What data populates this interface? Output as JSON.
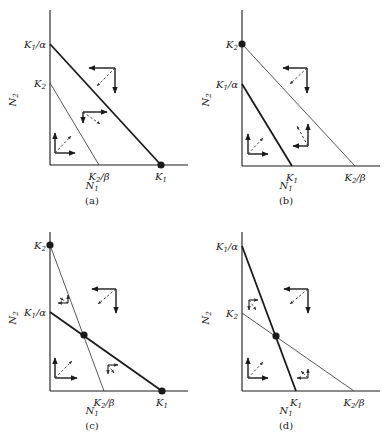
{
  "figure": {
    "background": "#ffffff",
    "ink": "#1a1a1a",
    "thin_line": "#444444",
    "panels": [
      {
        "id": "a",
        "caption": "(a)",
        "origin": [
          50,
          165
        ],
        "y_top": 10,
        "x_end": 188,
        "x_axis_label": "N1",
        "y_axis_label": "N2",
        "x_label_pos": [
          92,
          189
        ],
        "y_label_pos": [
          16,
          100
        ],
        "caption_pos": [
          92,
          204
        ],
        "lines": [
          {
            "name": "N1-isocline",
            "from": [
              50,
              44
            ],
            "to": [
              161,
              165
            ],
            "weight": "thick"
          },
          {
            "name": "N2-isocline",
            "from": [
              50,
              83
            ],
            "to": [
              99,
              165
            ],
            "weight": "thin"
          }
        ],
        "y_ticks": [
          {
            "text": "K1/α",
            "main": "K",
            "sub": "1",
            "suffix": "/α",
            "y": 44
          },
          {
            "text": "K2",
            "main": "K",
            "sub": "2",
            "suffix": "",
            "y": 83
          }
        ],
        "x_ticks": [
          {
            "text": "K2/β",
            "main": "K",
            "sub": "2",
            "suffix": "/β",
            "x": 99
          },
          {
            "text": "K1",
            "main": "K",
            "sub": "1",
            "suffix": "",
            "x": 161
          }
        ],
        "points": [
          [
            161,
            165
          ]
        ],
        "vectors": [
          {
            "corner": [
              115,
              68
            ],
            "h": [
              89,
              68
            ],
            "v": [
              115,
              93
            ],
            "d": [
              97,
              86
            ]
          },
          {
            "corner": [
              83,
              112
            ],
            "h": [
              107,
              112
            ],
            "v": [
              83,
              123
            ],
            "d": [
              100,
              124
            ]
          },
          {
            "corner": [
              55,
              153
            ],
            "h": [
              75,
              153
            ],
            "v": [
              55,
              133
            ],
            "d": [
              71,
              136
            ]
          }
        ]
      },
      {
        "id": "b",
        "caption": "(b)",
        "origin": [
          242,
          166
        ],
        "y_top": 10,
        "x_end": 380,
        "x_axis_label": "N1",
        "y_axis_label": "N2",
        "x_label_pos": [
          286,
          189
        ],
        "y_label_pos": [
          209,
          100
        ],
        "caption_pos": [
          286,
          204
        ],
        "lines": [
          {
            "name": "N2-isocline",
            "from": [
              242,
              44
            ],
            "to": [
              355,
              166
            ],
            "weight": "thin"
          },
          {
            "name": "N1-isocline",
            "from": [
              242,
              84
            ],
            "to": [
              292,
              166
            ],
            "weight": "thick"
          }
        ],
        "y_ticks": [
          {
            "text": "K2",
            "main": "K",
            "sub": "2",
            "suffix": "",
            "y": 44
          },
          {
            "text": "K1/α",
            "main": "K",
            "sub": "1",
            "suffix": "/α",
            "y": 84
          }
        ],
        "x_ticks": [
          {
            "text": "K1",
            "main": "K",
            "sub": "1",
            "suffix": "",
            "x": 292
          },
          {
            "text": "K2/β",
            "main": "K",
            "sub": "2",
            "suffix": "/β",
            "x": 355
          }
        ],
        "points": [
          [
            242,
            44
          ]
        ],
        "vectors": [
          {
            "corner": [
              307,
              68
            ],
            "h": [
              283,
              68
            ],
            "v": [
              307,
              93
            ],
            "d": [
              290,
              84
            ]
          },
          {
            "corner": [
              308,
              146
            ],
            "h": [
              293,
              146
            ],
            "v": [
              308,
              124
            ],
            "d": [
              297,
              126
            ]
          },
          {
            "corner": [
              248,
              154
            ],
            "h": [
              268,
              154
            ],
            "v": [
              248,
              134
            ],
            "d": [
              263,
              138
            ]
          }
        ]
      },
      {
        "id": "c",
        "caption": "(c)",
        "origin": [
          50,
          391
        ],
        "y_top": 232,
        "x_end": 188,
        "x_axis_label": "N1",
        "y_axis_label": "N2",
        "x_label_pos": [
          92,
          414
        ],
        "y_label_pos": [
          16,
          318
        ],
        "caption_pos": [
          92,
          429
        ],
        "lines": [
          {
            "name": "N2-isocline",
            "from": [
              50,
              245
            ],
            "to": [
              104,
              391
            ],
            "weight": "thin"
          },
          {
            "name": "N1-isocline",
            "from": [
              50,
              312
            ],
            "to": [
              162,
              391
            ],
            "weight": "thick"
          }
        ],
        "y_ticks": [
          {
            "text": "K2",
            "main": "K",
            "sub": "2",
            "suffix": "",
            "y": 245
          },
          {
            "text": "K1/α",
            "main": "K",
            "sub": "1",
            "suffix": "/α",
            "y": 312
          }
        ],
        "x_ticks": [
          {
            "text": "K2/β",
            "main": "K",
            "sub": "2",
            "suffix": "/β",
            "x": 104
          },
          {
            "text": "K1",
            "main": "K",
            "sub": "1",
            "suffix": "",
            "x": 162
          }
        ],
        "points": [
          [
            50,
            245
          ],
          [
            84,
            335
          ],
          [
            162,
            391
          ]
        ],
        "vectors": [
          {
            "corner": [
              116,
              289
            ],
            "h": [
              92,
              289
            ],
            "v": [
              116,
              313
            ],
            "d": [
              98,
              304
            ]
          },
          {
            "corner": [
              68,
              303
            ],
            "h": [
              58,
              303
            ],
            "v": [
              68,
              295
            ],
            "d": [
              60,
              298
            ],
            "small": true
          },
          {
            "corner": [
              108,
              365
            ],
            "h": [
              118,
              365
            ],
            "v": [
              108,
              374
            ],
            "d": [
              114,
              373
            ],
            "small": true
          },
          {
            "corner": [
              55,
              378
            ],
            "h": [
              77,
              378
            ],
            "v": [
              55,
              358
            ],
            "d": [
              72,
              361
            ]
          }
        ]
      },
      {
        "id": "d",
        "caption": "(d)",
        "origin": [
          242,
          391
        ],
        "y_top": 232,
        "x_end": 380,
        "x_axis_label": "N1",
        "y_axis_label": "N2",
        "x_label_pos": [
          286,
          414
        ],
        "y_label_pos": [
          209,
          318
        ],
        "caption_pos": [
          286,
          429
        ],
        "lines": [
          {
            "name": "N1-isocline",
            "from": [
              242,
              246
            ],
            "to": [
              296,
              391
            ],
            "weight": "thick"
          },
          {
            "name": "N2-isocline",
            "from": [
              242,
              313
            ],
            "to": [
              354,
              391
            ],
            "weight": "thin"
          }
        ],
        "y_ticks": [
          {
            "text": "K1/α",
            "main": "K",
            "sub": "1",
            "suffix": "/α",
            "y": 246
          },
          {
            "text": "K2",
            "main": "K",
            "sub": "2",
            "suffix": "",
            "y": 313
          }
        ],
        "x_ticks": [
          {
            "text": "K1",
            "main": "K",
            "sub": "1",
            "suffix": "",
            "x": 296
          },
          {
            "text": "K2/β",
            "main": "K",
            "sub": "2",
            "suffix": "/β",
            "x": 354
          }
        ],
        "points": [
          [
            276,
            336
          ]
        ],
        "vectors": [
          {
            "corner": [
              308,
              289
            ],
            "h": [
              284,
              289
            ],
            "v": [
              308,
              313
            ],
            "d": [
              290,
              304
            ]
          },
          {
            "corner": [
              249,
              300
            ],
            "h": [
              258,
              300
            ],
            "v": [
              249,
              310
            ],
            "d": [
              256,
              310
            ],
            "small": true
          },
          {
            "corner": [
              308,
              378
            ],
            "h": [
              297,
              378
            ],
            "v": [
              308,
              369
            ],
            "d": [
              301,
              371
            ],
            "small": true
          },
          {
            "corner": [
              248,
              378
            ],
            "h": [
              268,
              378
            ],
            "v": [
              248,
              358
            ],
            "d": [
              263,
              362
            ]
          }
        ]
      }
    ]
  }
}
